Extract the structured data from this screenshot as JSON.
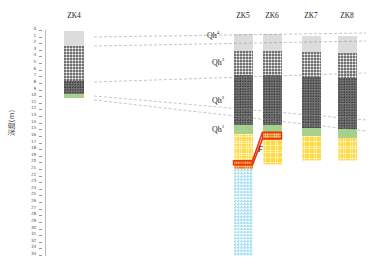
{
  "axis": {
    "title": "深度(m)",
    "unit": "m",
    "min": 0,
    "max": 34,
    "ticks": [
      0,
      1,
      2,
      3,
      4,
      5,
      6,
      7,
      8,
      9,
      10,
      11,
      12,
      13,
      14,
      15,
      16,
      17,
      18,
      19,
      20,
      21,
      22,
      23,
      24,
      25,
      26,
      27,
      28,
      29,
      30,
      31,
      32,
      33,
      34
    ]
  },
  "chart_data": {
    "type": "table",
    "title": "",
    "xlabel": "",
    "ylabel": "深度(m)",
    "ylim": [
      0,
      34
    ],
    "grid": false,
    "legend": "none",
    "boreholes": [
      {
        "name": "ZK4",
        "x_px": 74,
        "width_px": 20,
        "top_depth": 0,
        "bottom_depth": 10.2,
        "layers": [
          {
            "lithology": "light-gray-silt",
            "color": "#dcdcdc",
            "from": 0.0,
            "to": 2.2
          },
          {
            "lithology": "dotted-gray-sand",
            "color": "#bdbdbd",
            "from": 2.2,
            "to": 7.6
          },
          {
            "lithology": "dark-gray-clay",
            "color": "#767676",
            "from": 7.6,
            "to": 9.5
          },
          {
            "lithology": "green-mudstone",
            "color": "#a8d08d",
            "from": 9.5,
            "to": 10.2
          }
        ]
      },
      {
        "name": "ZK5",
        "x_px": 243,
        "width_px": 19,
        "top_depth": 0.5,
        "bottom_depth": 34.0,
        "layers": [
          {
            "lithology": "light-gray-silt",
            "color": "#dcdcdc",
            "from": 0.5,
            "to": 3.0
          },
          {
            "lithology": "dotted-gray-sand",
            "color": "#bdbdbd",
            "from": 3.0,
            "to": 6.6
          },
          {
            "lithology": "dark-gray-clay",
            "color": "#767676",
            "from": 6.6,
            "to": 14.2
          },
          {
            "lithology": "green-mudstone",
            "color": "#a8d08d",
            "from": 14.2,
            "to": 15.6
          },
          {
            "lithology": "yellow-sandstone",
            "color": "#ffd942",
            "from": 15.6,
            "to": 19.6
          },
          {
            "lithology": "orange-conglomerate",
            "color": "#f07d1a",
            "from": 19.6,
            "to": 20.8
          },
          {
            "lithology": "cyan-limestone",
            "color": "#9fdcf0",
            "from": 20.8,
            "to": 34.0
          }
        ]
      },
      {
        "name": "ZK6",
        "x_px": 272,
        "width_px": 19,
        "top_depth": 0.5,
        "bottom_depth": 20.2,
        "layers": [
          {
            "lithology": "light-gray-silt",
            "color": "#dcdcdc",
            "from": 0.5,
            "to": 3.0
          },
          {
            "lithology": "dotted-gray-sand",
            "color": "#bdbdbd",
            "from": 3.0,
            "to": 6.6
          },
          {
            "lithology": "dark-gray-clay",
            "color": "#767676",
            "from": 6.6,
            "to": 14.2
          },
          {
            "lithology": "green-mudstone",
            "color": "#a8d08d",
            "from": 14.2,
            "to": 15.3
          },
          {
            "lithology": "orange-conglomerate",
            "color": "#f07d1a",
            "from": 15.3,
            "to": 16.3
          },
          {
            "lithology": "yellow-sandstone",
            "color": "#ffd942",
            "from": 16.3,
            "to": 20.2
          }
        ]
      },
      {
        "name": "ZK7",
        "x_px": 311,
        "width_px": 19,
        "top_depth": 0.8,
        "bottom_depth": 19.6,
        "layers": [
          {
            "lithology": "light-gray-silt",
            "color": "#dcdcdc",
            "from": 0.8,
            "to": 3.2
          },
          {
            "lithology": "dotted-gray-sand",
            "color": "#bdbdbd",
            "from": 3.2,
            "to": 6.9
          },
          {
            "lithology": "dark-gray-clay",
            "color": "#767676",
            "from": 6.9,
            "to": 14.6
          },
          {
            "lithology": "green-mudstone",
            "color": "#a8d08d",
            "from": 14.6,
            "to": 15.9
          },
          {
            "lithology": "yellow-sandstone",
            "color": "#ffd942",
            "from": 15.9,
            "to": 19.6
          }
        ]
      },
      {
        "name": "ZK8",
        "x_px": 347,
        "width_px": 19,
        "top_depth": 0.8,
        "bottom_depth": 19.6,
        "layers": [
          {
            "lithology": "light-gray-silt",
            "color": "#dcdcdc",
            "from": 0.8,
            "to": 3.4
          },
          {
            "lithology": "dotted-gray-sand",
            "color": "#bdbdbd",
            "from": 3.4,
            "to": 7.1
          },
          {
            "lithology": "dark-gray-clay",
            "color": "#767676",
            "from": 7.1,
            "to": 14.8
          },
          {
            "lithology": "green-mudstone",
            "color": "#a8d08d",
            "from": 14.8,
            "to": 16.1
          },
          {
            "lithology": "yellow-sandstone",
            "color": "#ffd942",
            "from": 16.1,
            "to": 19.6
          }
        ]
      }
    ],
    "strat_labels": [
      {
        "base": "Qh",
        "sup": "4",
        "x_px": 207,
        "y_px": 30
      },
      {
        "base": "Qh",
        "sup": "3",
        "x_px": 212,
        "y_px": 57
      },
      {
        "base": "Qh",
        "sup": "2",
        "x_px": 212,
        "y_px": 95
      },
      {
        "base": "Qh",
        "sup": "1",
        "x_px": 212,
        "y_px": 124
      }
    ],
    "fault": {
      "label": "F",
      "label_x_px": 258,
      "label_y_px": 145,
      "color": "#e8350d"
    },
    "correlation_lines": [
      {
        "name": "Qh4-base",
        "from": [
          94,
          37
        ],
        "to": [
          366,
          33
        ]
      },
      {
        "name": "Qh3-base",
        "from": [
          94,
          46
        ],
        "to": [
          366,
          41
        ]
      },
      {
        "name": "Qh2-base",
        "from": [
          94,
          82
        ],
        "to": [
          366,
          73
        ]
      },
      {
        "name": "Qh1-base",
        "from": [
          94,
          96
        ],
        "to": [
          366,
          120
        ]
      },
      {
        "name": "Qh1-top",
        "from": [
          94,
          100
        ],
        "to": [
          366,
          131
        ]
      }
    ]
  }
}
